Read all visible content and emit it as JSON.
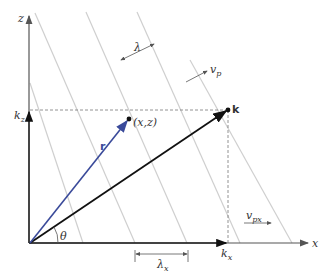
{
  "diagram": {
    "axes": {
      "x_label": "x",
      "z_label": "z"
    },
    "labels": {
      "k_vector": "k",
      "r_vector": "r",
      "point": "(x,z)",
      "kz": "k",
      "kz_sub": "z",
      "kx": "k",
      "kx_sub": "x",
      "theta": "θ",
      "lambda": "λ",
      "lambda_x": "λ",
      "lambda_x_sub": "x",
      "vp": "v",
      "vp_sub": "p",
      "vpx": "v",
      "vpx_sub": "px"
    },
    "colors": {
      "r_vector": "#3a4a9a",
      "k_vector": "#111111",
      "wavefronts": "#cfcfcf",
      "axes": "#555555"
    }
  }
}
